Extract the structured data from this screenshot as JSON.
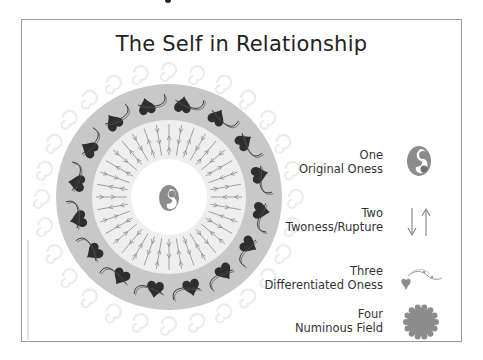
{
  "title": "The Self in Relationship",
  "legend": [
    {
      "number": "One",
      "label": "Original Oness",
      "icon": "mother-child-icon"
    },
    {
      "number": "Two",
      "label": "Twoness/Rupture",
      "icon": "up-down-arrows-icon"
    },
    {
      "number": "Three",
      "label": "Differentiated Oness",
      "icon": "heart-vine-icon"
    },
    {
      "number": "Four",
      "label": "Numinous Field",
      "icon": "scalloped-circle-icon"
    }
  ],
  "colors": {
    "frame_border": "#9a9a9a",
    "outer_ring": "#c8c8c8",
    "inner_ring": "#eeeeee",
    "center": "#ffffff",
    "hearts": "#2e2e2e",
    "arrows": "#8a8a8a",
    "swirls": "#ececec",
    "icon_gray": "#8c8c8c"
  },
  "diagram": {
    "center_x": 147,
    "center_y": 177,
    "outer_radius": 113,
    "inner_radius": 77,
    "core_radius": 38,
    "heart_count": 16,
    "arrow_count": 36
  }
}
